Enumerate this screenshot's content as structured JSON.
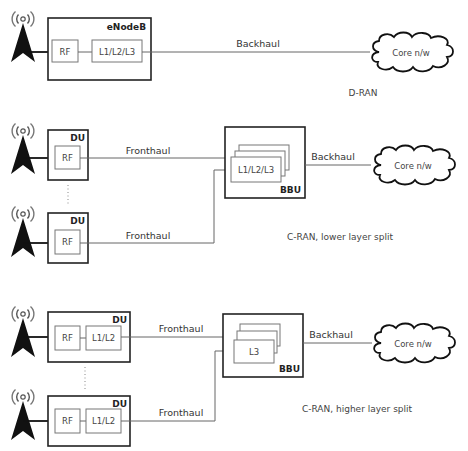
{
  "diagram": {
    "sections": [
      {
        "name": "D-RAN",
        "label": "D-RAN",
        "unit": "eNodeB",
        "unit_blocks": [
          "RF",
          "L1/L2/L3"
        ],
        "link": "Backhaul",
        "core": "Core n/w"
      },
      {
        "name": "C-RAN lower layer split",
        "label": "C-RAN, lower layer split",
        "du_label": "DU",
        "du_blocks": [
          "RF"
        ],
        "fronthaul": "Fronthaul",
        "bbu_label": "BBU",
        "bbu_block": "L1/L2/L3",
        "link": "Backhaul",
        "core": "Core n/w"
      },
      {
        "name": "C-RAN higher layer split",
        "label": "C-RAN, higher layer split",
        "du_label": "DU",
        "du_blocks": [
          "RF",
          "L1/L2"
        ],
        "fronthaul": "Fronthaul",
        "bbu_label": "BBU",
        "bbu_block": "L3",
        "link": "Backhaul",
        "core": "Core n/w"
      }
    ],
    "icons": {
      "tower": "antenna-tower-icon",
      "cloud": "cloud-icon"
    }
  }
}
